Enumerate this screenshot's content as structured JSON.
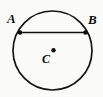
{
  "figure": {
    "background_color": "#fbfbfa",
    "stroke_color": "#141414",
    "labels": {
      "point_a": "A",
      "point_b": "B",
      "center_c": "C"
    },
    "icons": {
      "circle": "circle-outline-icon",
      "chord": "chord-line-icon",
      "center_dot": "center-point-dot-icon",
      "endpoint_a": "endpoint-dot-icon",
      "endpoint_b": "endpoint-dot-icon"
    }
  },
  "chart_data": {
    "type": "scatter",
    "xlabel": "",
    "ylabel": "",
    "xlim": [
      0,
      103
    ],
    "ylim": [
      0,
      97
    ],
    "grid": false,
    "legend": null,
    "geometry": {
      "circle": {
        "center_x": 52.5,
        "center_y": 50.5,
        "radius": 39.5,
        "stroke_width": 1.7,
        "fill": "none"
      },
      "chord": {
        "from": "A",
        "to": "B",
        "x1": 20.0,
        "y1": 32.5,
        "x2": 85.5,
        "y2": 32.5,
        "stroke_width": 1.7,
        "length": 65.5
      },
      "points": [
        {
          "name": "A",
          "x": 20.0,
          "y": 32.5,
          "radius": 2.3,
          "on_circle": true
        },
        {
          "name": "B",
          "x": 85.5,
          "y": 32.5,
          "radius": 2.3,
          "on_circle": true
        },
        {
          "name": "C",
          "x": 53.5,
          "y": 50.3,
          "radius": 2.2,
          "on_circle": false
        }
      ]
    },
    "annotations": [
      {
        "text": "A",
        "x": 7,
        "y": 12,
        "style": "italic-bold"
      },
      {
        "text": "B",
        "x": 88,
        "y": 13,
        "style": "italic-bold"
      },
      {
        "text": "C",
        "x": 42,
        "y": 53,
        "style": "italic-bold"
      }
    ]
  }
}
